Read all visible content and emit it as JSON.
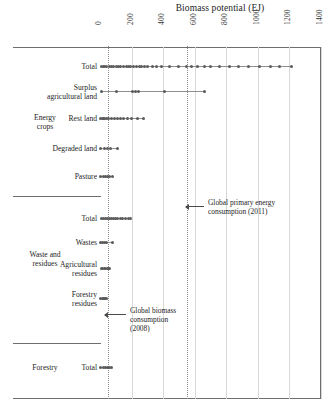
{
  "chart_data": {
    "type": "scatter",
    "title": "Biomass potential (EJ)",
    "xlabel": "Biomass potential (EJ)",
    "ylabel": "",
    "xlim": [
      0,
      1400
    ],
    "ticks": [
      "0",
      "200",
      "400",
      "600",
      "800",
      "1000",
      "1200",
      "1400"
    ],
    "tick_values": [
      0,
      200,
      400,
      600,
      800,
      1000,
      1200,
      1400
    ],
    "grid": true,
    "legend": "none",
    "orientation": "horizontal",
    "groups": [
      {
        "name": "Energy crops",
        "categories": [
          {
            "label": "Total",
            "label_lines": [
              "Total"
            ],
            "range": [
              10,
              1215
            ],
            "values": [
              10,
              22,
              30,
              44,
              60,
              75,
              88,
              104,
              118,
              132,
              150,
              166,
              180,
              196,
              215,
              232,
              248,
              264,
              280,
              300,
              330,
              360,
              392,
              440,
              500,
              545,
              580,
              620,
              660,
              700,
              760,
              820,
              880,
              940,
              1010,
              1080,
              1140,
              1215
            ]
          },
          {
            "label": "Surplus agricultural land",
            "label_lines": [
              "Surplus",
              "agricultural land"
            ],
            "range": [
              8,
              662
            ],
            "values": [
              8,
              105,
              205,
              225,
              245,
              410,
              662
            ]
          },
          {
            "label": "Rest land",
            "label_lines": [
              "Rest land"
            ],
            "range": [
              5,
              275
            ],
            "values": [
              5,
              14,
              22,
              30,
              40,
              52,
              70,
              90,
              110,
              130,
              150,
              172,
              200,
              240,
              275
            ]
          },
          {
            "label": "Degraded land",
            "label_lines": [
              "Degraded land"
            ],
            "range": [
              5,
              112
            ],
            "values": [
              5,
              28,
              48,
              66,
              112
            ]
          },
          {
            "label": "Pasture",
            "label_lines": [
              "Pasture"
            ],
            "range": [
              5,
              82
            ],
            "values": [
              5,
              24,
              38,
              50,
              62,
              82
            ]
          }
        ]
      },
      {
        "name": "Waste and residues",
        "categories": [
          {
            "label": "Total",
            "label_lines": [
              "Total"
            ],
            "range": [
              8,
              192
            ],
            "values": [
              8,
              20,
              32,
              46,
              58,
              70,
              84,
              98,
              112,
              128,
              145,
              162,
              178,
              192
            ]
          },
          {
            "label": "Wastes",
            "label_lines": [
              "Wastes"
            ],
            "range": [
              6,
              78
            ],
            "values": [
              6,
              18,
              30,
              42,
              78
            ]
          },
          {
            "label": "Agricultural residues",
            "label_lines": [
              "Agricultural",
              "residues"
            ],
            "range": [
              8,
              62
            ],
            "values": [
              8,
              18,
              28,
              38,
              48,
              56,
              62
            ]
          },
          {
            "label": "Forestry residues",
            "label_lines": [
              "Forestry",
              "residues"
            ],
            "range": [
              5,
              42
            ],
            "values": [
              5,
              14,
              22,
              30,
              36,
              42
            ]
          }
        ]
      },
      {
        "name": "Forestry",
        "categories": [
          {
            "label": "Total",
            "label_lines": [
              "Total"
            ],
            "range": [
              6,
              72
            ],
            "values": [
              6,
              20,
              34,
              46,
              58,
              72
            ]
          }
        ]
      }
    ],
    "reference_lines": [
      {
        "name": "Global biomass consumption (2008)",
        "label_lines": [
          "Global biomass",
          "consumption",
          "(2008)"
        ],
        "value": 50
      },
      {
        "name": "Global primary energy consumption (2011)",
        "label_lines": [
          "Global primary energy",
          "consumption (2011)"
        ],
        "value": 550
      }
    ],
    "colors": {
      "point": "#5b5b5b",
      "line": "#8f8f8f",
      "grid": "#d8d8d8",
      "reference": "#8a8a8a",
      "axis": "#6e6e6e"
    }
  }
}
